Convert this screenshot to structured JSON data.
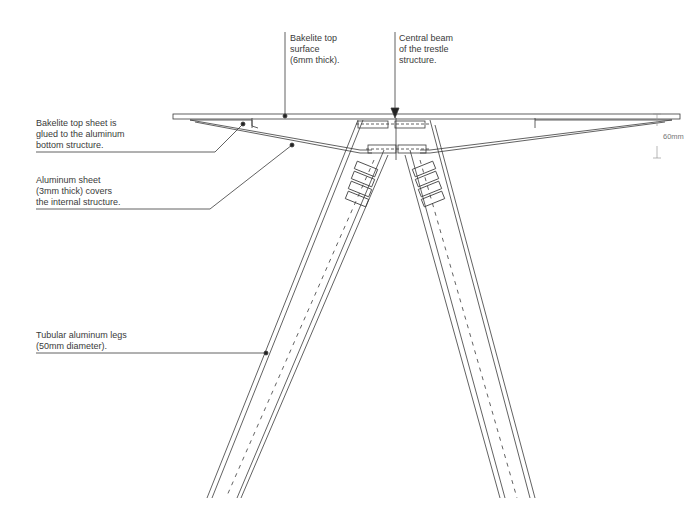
{
  "diagram": {
    "type": "technical-drawing",
    "colors": {
      "line": "#3a3a3a",
      "background": "#ffffff",
      "dimension": "#9a9a9a"
    }
  },
  "annotations": [
    {
      "id": "bakelite-top-surface",
      "text": "Bakelite top\nsurface\n(6mm thick)."
    },
    {
      "id": "central-beam",
      "text": "Central beam\nof the trestle\nstructure."
    },
    {
      "id": "bakelite-glued",
      "text": "Bakelite top sheet is\nglued to the aluminum\nbottom structure."
    },
    {
      "id": "aluminum-sheet",
      "text": "Aluminum sheet\n(3mm thick) covers\nthe internal structure."
    },
    {
      "id": "tubular-legs",
      "text": "Tubular aluminum legs\n(50mm diameter)."
    }
  ],
  "dimension": {
    "label": "60mm"
  }
}
